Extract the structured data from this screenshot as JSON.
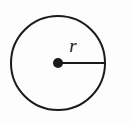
{
  "diagram": {
    "name": "circle-with-radius",
    "background_color": "#fdfdfd",
    "stroke_color": "#1a1a1a",
    "circle": {
      "center_x": 58,
      "center_y": 63,
      "radius": 47,
      "stroke_width": 2,
      "fill": "none"
    },
    "center_point": {
      "label": "center-dot",
      "cx": 58,
      "cy": 63,
      "r": 5,
      "fill": "#1a1a1a"
    },
    "radius_segment": {
      "label": "radius-line",
      "x1": 58,
      "y1": 63,
      "x2": 105,
      "y2": 63,
      "stroke_width": 2
    },
    "radius_label": {
      "text": "r",
      "x": 73,
      "y": 52,
      "font_size": 19,
      "style": "italic"
    }
  }
}
